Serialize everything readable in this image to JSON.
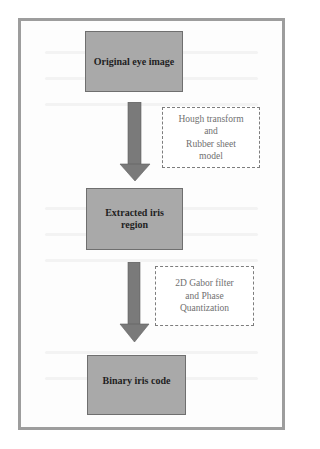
{
  "diagram": {
    "type": "flowchart",
    "direction": "top-to-bottom",
    "colors": {
      "frame_border": "#9d9d9d",
      "box_fill": "#a9a9a9",
      "box_border": "#6f6f6f",
      "arrow_fill": "#7a7a7a",
      "dashed_border": "#7d7d7d",
      "box_text": "#1f1f1f",
      "annotation_text": "#707070"
    },
    "steps": [
      {
        "id": "step1",
        "label": "Original eye image"
      },
      {
        "id": "step2",
        "label": "Extracted iris region"
      },
      {
        "id": "step3",
        "label": "Binary iris code"
      }
    ],
    "transitions": [
      {
        "from": "step1",
        "to": "step2",
        "annotation_lines": [
          "Hough transform",
          "and",
          "Rubber sheet",
          "model"
        ]
      },
      {
        "from": "step2",
        "to": "step3",
        "annotation_lines": [
          "2D Gabor filter",
          "and Phase",
          "Quantization"
        ]
      }
    ]
  }
}
